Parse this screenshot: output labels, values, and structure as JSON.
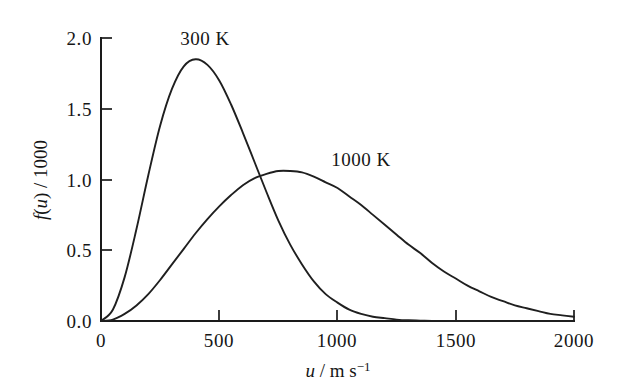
{
  "figure": {
    "background_color": "#ffffff",
    "line_color": "#1f1f1f",
    "axis_color": "#1a1a1a"
  },
  "axes": {
    "x": {
      "title_parts": {
        "variable": "u",
        "separator": " / m s",
        "exponent": "−1"
      },
      "title_text": "u / m s⁻¹",
      "ticks": [
        {
          "value": 0,
          "label": "0"
        },
        {
          "value": 500,
          "label": "500"
        },
        {
          "value": 1000,
          "label": "1000"
        },
        {
          "value": 1500,
          "label": "1500"
        },
        {
          "value": 2000,
          "label": "2000"
        }
      ],
      "range": [
        0,
        2000
      ]
    },
    "y": {
      "title_parts": {
        "variable": "f",
        "argument": "(u)",
        "separator": " / 1000"
      },
      "title_text": "f(u) / 1000",
      "ticks": [
        {
          "value": 0.0,
          "label": "0.0"
        },
        {
          "value": 0.5,
          "label": "0.5"
        },
        {
          "value": 1.0,
          "label": "1.0"
        },
        {
          "value": 1.5,
          "label": "1.5"
        },
        {
          "value": 2.0,
          "label": "2.0"
        }
      ],
      "range": [
        0.0,
        2.0
      ]
    }
  },
  "annotations": [
    {
      "name": "label-300K",
      "text": "300 K",
      "x_px": 205,
      "y_px": 45
    },
    {
      "name": "label-1000K",
      "text": "1000 K",
      "x_px": 361,
      "y_px": 166
    }
  ],
  "chart_data": {
    "type": "line",
    "title": "",
    "subtitle": "",
    "xlabel": "u / m s⁻¹",
    "ylabel": "f(u) / 1000",
    "xlim": [
      0,
      2000
    ],
    "ylim": [
      0,
      2.0
    ],
    "grid": false,
    "legend": "inline-annotations",
    "x": [
      0,
      50,
      100,
      150,
      200,
      250,
      300,
      350,
      400,
      450,
      500,
      550,
      600,
      650,
      700,
      750,
      800,
      850,
      900,
      950,
      1000,
      1050,
      1100,
      1150,
      1200,
      1250,
      1300,
      1350,
      1400,
      1450,
      1500,
      1550,
      1600,
      1650,
      1700,
      1750,
      1800,
      1850,
      1900,
      1950,
      2000
    ],
    "series": [
      {
        "name": "300 K",
        "label": "300 K",
        "peak_x": 420,
        "peak_y": 1.85,
        "values": [
          0.0,
          0.08,
          0.31,
          0.65,
          1.03,
          1.38,
          1.64,
          1.8,
          1.85,
          1.81,
          1.7,
          1.53,
          1.33,
          1.12,
          0.91,
          0.71,
          0.54,
          0.4,
          0.28,
          0.19,
          0.13,
          0.08,
          0.05,
          0.03,
          0.02,
          0.01,
          0.005,
          0.003,
          0.001,
          0.001,
          0.0,
          0.0,
          0.0,
          0.0,
          0.0,
          0.0,
          0.0,
          0.0,
          0.0,
          0.0,
          0.0
        ]
      },
      {
        "name": "1000 K",
        "label": "1000 K",
        "peak_x": 765,
        "peak_y": 1.06,
        "values": [
          0.0,
          0.01,
          0.05,
          0.11,
          0.19,
          0.29,
          0.4,
          0.51,
          0.62,
          0.72,
          0.81,
          0.89,
          0.96,
          1.01,
          1.04,
          1.06,
          1.06,
          1.05,
          1.02,
          0.98,
          0.94,
          0.88,
          0.82,
          0.75,
          0.68,
          0.61,
          0.54,
          0.48,
          0.41,
          0.35,
          0.3,
          0.25,
          0.21,
          0.17,
          0.14,
          0.11,
          0.09,
          0.07,
          0.05,
          0.04,
          0.03
        ]
      }
    ]
  }
}
